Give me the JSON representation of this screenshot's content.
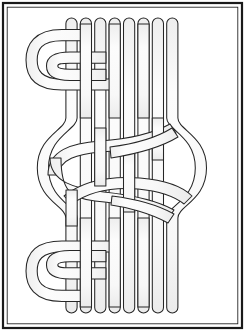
{
  "artwork": {
    "title": "Celtic Turk's Head Knot Line Drawing",
    "style": "line-art",
    "canvas": {
      "width": 245,
      "height": 331
    },
    "colors": {
      "background": "#ffffff",
      "frame_stroke": "#1a1a1a",
      "strand_stroke": "#262626",
      "strand_fill": "#fbfbfb",
      "strand_shade": "#efefef"
    },
    "frame": {
      "outer_inset": 3,
      "inner_inset": 7,
      "outer_stroke_width": 2.2,
      "inner_stroke_width": 0.9
    },
    "strands": {
      "count": 8,
      "band_width": 11.2,
      "first_center_x": 71.5,
      "spacing": 14.4,
      "cap_top_y": 18,
      "cap_bottom_y": 313,
      "cap_radius": 5.6,
      "cap_height": 26
    },
    "return_loops": {
      "top_left": {
        "outer_x": 27,
        "inner_x": 42,
        "top_y": 23,
        "bottom_y": 66
      },
      "bottom_left": {
        "outer_x": 27,
        "inner_x": 42,
        "top_y": 265,
        "bottom_y": 308
      }
    },
    "knot": {
      "center_y": 168,
      "top_y": 118,
      "bottom_y": 220,
      "left_bulge_x": 45,
      "right_bulge_x": 199,
      "crossings": 6
    }
  },
  "labels": {
    "figure_caption": ""
  }
}
